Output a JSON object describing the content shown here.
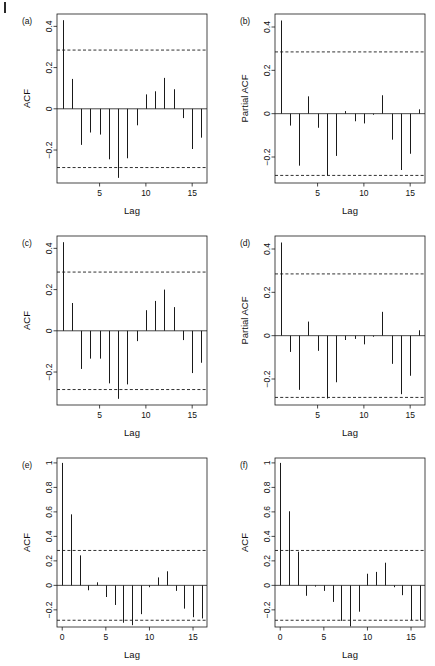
{
  "figure": {
    "background": "#ffffff",
    "line_color": "#1a1a1a",
    "conf_line_color": "#1a1a1a",
    "panel_count": 6,
    "corner_mark": "page-edge-mark"
  },
  "panels": [
    {
      "id": "a",
      "label": "(a)",
      "ylabel": "ACF",
      "xlabel": "Lag"
    },
    {
      "id": "b",
      "label": "(b)",
      "ylabel": "Partial ACF",
      "xlabel": "Lag"
    },
    {
      "id": "c",
      "label": "(c)",
      "ylabel": "ACF",
      "xlabel": "Lag"
    },
    {
      "id": "d",
      "label": "(d)",
      "ylabel": "Partial ACF",
      "xlabel": "Lag"
    },
    {
      "id": "e",
      "label": "(e)",
      "ylabel": "ACF",
      "xlabel": "Lag"
    },
    {
      "id": "f",
      "label": "(f)",
      "ylabel": "ACF",
      "xlabel": "Lag"
    }
  ],
  "chart_data": [
    {
      "type": "bar",
      "panel": "a",
      "title": "(a)",
      "xlabel": "Lag",
      "ylabel": "ACF",
      "x": [
        1,
        2,
        3,
        4,
        5,
        6,
        7,
        8,
        9,
        10,
        11,
        12,
        13,
        14,
        15,
        16
      ],
      "values": [
        0.43,
        0.145,
        -0.175,
        -0.115,
        -0.125,
        -0.245,
        -0.335,
        -0.24,
        -0.08,
        0.07,
        0.085,
        0.15,
        0.095,
        -0.045,
        -0.195,
        -0.14
      ],
      "xticks": [
        5,
        10,
        15
      ],
      "yticks": [
        -0.2,
        0.0,
        0.2,
        0.4
      ],
      "xlim": [
        0.4,
        16.6
      ],
      "ylim": [
        -0.36,
        0.46
      ],
      "grid": false,
      "conf_bounds": [
        0.285,
        -0.285
      ],
      "conf_style": "dashed",
      "legend": "none"
    },
    {
      "type": "bar",
      "panel": "b",
      "title": "(b)",
      "xlabel": "Lag",
      "ylabel": "Partial ACF",
      "x": [
        1,
        2,
        3,
        4,
        5,
        6,
        7,
        8,
        9,
        10,
        11,
        12,
        13,
        14,
        15,
        16
      ],
      "values": [
        0.43,
        -0.055,
        -0.24,
        0.08,
        -0.065,
        -0.285,
        -0.195,
        0.012,
        -0.035,
        -0.045,
        -0.005,
        0.085,
        -0.12,
        -0.26,
        -0.185,
        0.02
      ],
      "xticks": [
        5,
        10,
        15
      ],
      "yticks": [
        -0.2,
        0.0,
        0.2,
        0.4
      ],
      "xlim": [
        0.4,
        16.6
      ],
      "ylim": [
        -0.32,
        0.46
      ],
      "grid": false,
      "conf_bounds": [
        0.285,
        -0.285
      ],
      "conf_style": "dashed",
      "legend": "none"
    },
    {
      "type": "bar",
      "panel": "c",
      "title": "(c)",
      "xlabel": "Lag",
      "ylabel": "ACF",
      "x": [
        1,
        2,
        3,
        4,
        5,
        6,
        7,
        8,
        9,
        10,
        11,
        12,
        13,
        14,
        15,
        16
      ],
      "values": [
        0.43,
        0.135,
        -0.185,
        -0.135,
        -0.135,
        -0.255,
        -0.33,
        -0.26,
        -0.05,
        0.1,
        0.145,
        0.2,
        0.115,
        -0.045,
        -0.205,
        -0.155
      ],
      "xticks": [
        5,
        10,
        15
      ],
      "yticks": [
        -0.2,
        0.0,
        0.2,
        0.4
      ],
      "xlim": [
        0.4,
        16.6
      ],
      "ylim": [
        -0.36,
        0.46
      ],
      "grid": false,
      "conf_bounds": [
        0.285,
        -0.285
      ],
      "conf_style": "dashed",
      "legend": "none"
    },
    {
      "type": "bar",
      "panel": "d",
      "title": "(d)",
      "xlabel": "Lag",
      "ylabel": "Partial ACF",
      "x": [
        1,
        2,
        3,
        4,
        5,
        6,
        7,
        8,
        9,
        10,
        11,
        12,
        13,
        14,
        15,
        16
      ],
      "values": [
        0.43,
        -0.075,
        -0.25,
        0.065,
        -0.07,
        -0.29,
        -0.215,
        -0.02,
        -0.015,
        -0.04,
        -0.005,
        0.11,
        -0.13,
        -0.27,
        -0.185,
        0.025
      ],
      "xticks": [
        5,
        10,
        15
      ],
      "yticks": [
        -0.2,
        0.0,
        0.2,
        0.4
      ],
      "xlim": [
        0.4,
        16.6
      ],
      "ylim": [
        -0.32,
        0.46
      ],
      "grid": false,
      "conf_bounds": [
        0.285,
        -0.285
      ],
      "conf_style": "dashed",
      "legend": "none"
    },
    {
      "type": "bar",
      "panel": "e",
      "title": "(e)",
      "xlabel": "Lag",
      "ylabel": "ACF",
      "x": [
        0,
        1,
        2,
        3,
        4,
        5,
        6,
        7,
        8,
        9,
        10,
        11,
        12,
        13,
        14,
        15,
        16
      ],
      "values": [
        1.0,
        0.58,
        0.245,
        -0.04,
        0.025,
        -0.095,
        -0.16,
        -0.305,
        -0.325,
        -0.235,
        -0.015,
        0.065,
        0.115,
        -0.045,
        -0.19,
        -0.26,
        -0.27
      ],
      "xticks": [
        0,
        5,
        10,
        15
      ],
      "yticks": [
        -0.2,
        0.0,
        0.2,
        0.4,
        0.6,
        0.8,
        1.0
      ],
      "xlim": [
        -0.6,
        16.6
      ],
      "ylim": [
        -0.34,
        1.04
      ],
      "grid": false,
      "conf_bounds": [
        0.285,
        -0.285
      ],
      "conf_style": "dashed",
      "legend": "none"
    },
    {
      "type": "bar",
      "panel": "f",
      "title": "(f)",
      "xlabel": "Lag",
      "ylabel": "ACF",
      "x": [
        0,
        1,
        2,
        3,
        4,
        5,
        6,
        7,
        8,
        9,
        10,
        11,
        12,
        13,
        14,
        15,
        16
      ],
      "values": [
        1.0,
        0.605,
        0.275,
        -0.085,
        -0.01,
        -0.045,
        -0.135,
        -0.29,
        -0.335,
        -0.215,
        0.095,
        0.11,
        0.185,
        -0.015,
        -0.08,
        -0.285,
        -0.285
      ],
      "xticks": [
        0,
        5,
        10,
        15
      ],
      "yticks": [
        -0.2,
        0.0,
        0.2,
        0.4,
        0.6,
        0.8,
        1.0
      ],
      "xlim": [
        -0.6,
        16.6
      ],
      "ylim": [
        -0.34,
        1.04
      ],
      "grid": false,
      "conf_bounds": [
        0.285,
        -0.285
      ],
      "conf_style": "dashed",
      "legend": "none"
    }
  ]
}
